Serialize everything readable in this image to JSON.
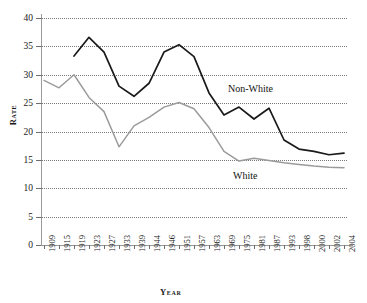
{
  "chart_data": {
    "type": "line",
    "title": "",
    "xlabel": "Year",
    "ylabel": "Rate",
    "ylim": [
      0,
      40
    ],
    "ytick_step": 5,
    "yticks": [
      0,
      5,
      10,
      15,
      20,
      25,
      30,
      35,
      40
    ],
    "grid": true,
    "legend_position": "inline-annotations",
    "categories": [
      "1909",
      "1915",
      "1919",
      "1923",
      "1927",
      "1933",
      "1939",
      "1944",
      "1946",
      "1951",
      "1957",
      "1963",
      "1969",
      "1975",
      "1981",
      "1987",
      "1993",
      "1998",
      "2000",
      "2002",
      "2004"
    ],
    "series": [
      {
        "name": "Non-White",
        "color": "#1a1a1a",
        "values": [
          null,
          null,
          33.3,
          36.6,
          34.0,
          28.0,
          26.2,
          28.5,
          34.0,
          35.3,
          33.2,
          26.8,
          22.9,
          24.3,
          22.2,
          24.1,
          18.5,
          16.9,
          16.5,
          15.9,
          16.2
        ]
      },
      {
        "name": "White",
        "color": "#9b9b9b",
        "values": [
          29.0,
          27.7,
          30.0,
          26.0,
          23.5,
          17.3,
          21.0,
          22.5,
          24.3,
          25.1,
          24.0,
          20.7,
          16.5,
          14.8,
          15.3,
          14.9,
          14.5,
          14.2,
          13.9,
          13.7,
          13.6
        ]
      }
    ],
    "annotations": [
      {
        "text": "Non-White",
        "x_year": "1981",
        "y_value": 29.0
      },
      {
        "text": "White",
        "x_year": "1987",
        "y_value": 13.0
      }
    ]
  }
}
